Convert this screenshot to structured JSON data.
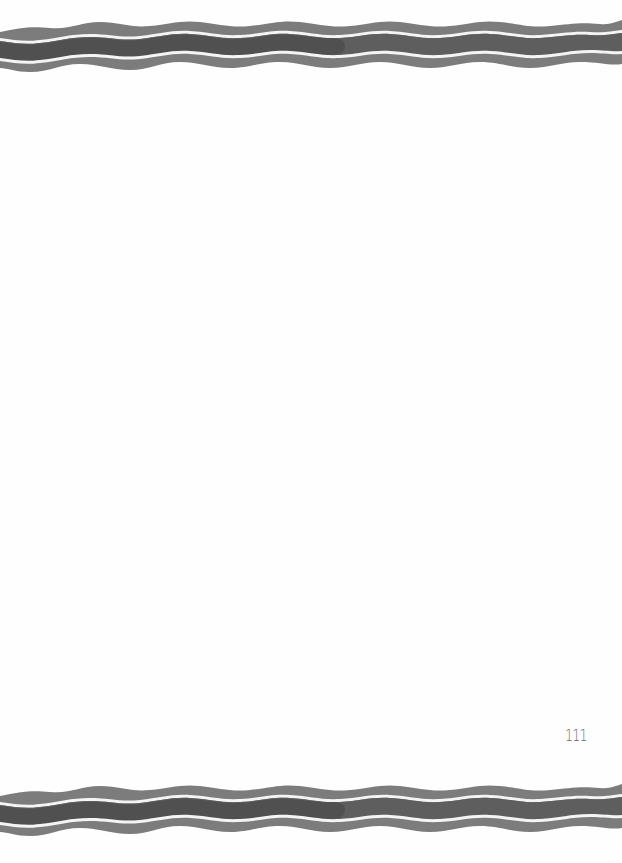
{
  "page": {
    "number": "111",
    "background": "#ffffff"
  },
  "decorations": {
    "top_border": {
      "type": "wavy-stripes",
      "colors": {
        "outer": "#7c7c7c",
        "inner": "#5e5e5e",
        "inner_dark": "#4a4a4a",
        "gap": "#f4f4f4"
      }
    },
    "bottom_border": {
      "type": "wavy-stripes",
      "colors": {
        "outer": "#7c7c7c",
        "inner": "#5e5e5e",
        "inner_dark": "#4a4a4a",
        "gap": "#f4f4f4"
      }
    }
  }
}
